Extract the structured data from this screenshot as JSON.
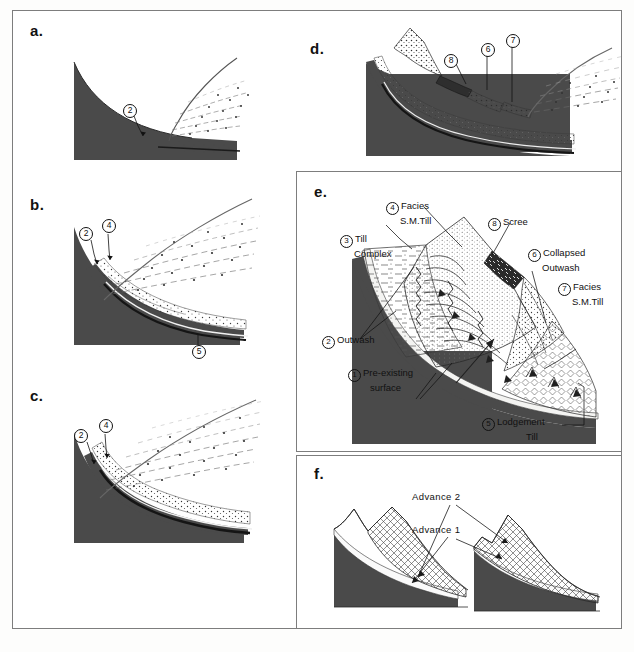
{
  "figure": {
    "panels": [
      {
        "id": "a",
        "letter": "a."
      },
      {
        "id": "b",
        "letter": "b."
      },
      {
        "id": "c",
        "letter": "c."
      },
      {
        "id": "d",
        "letter": "d."
      },
      {
        "id": "e",
        "letter": "e."
      },
      {
        "id": "f",
        "letter": "f."
      }
    ]
  },
  "panel_a": {
    "letter": "a.",
    "labels": [
      {
        "number": "2",
        "text": ""
      }
    ]
  },
  "panel_b": {
    "letter": "b.",
    "labels": [
      {
        "number": "2",
        "text": ""
      },
      {
        "number": "4",
        "text": ""
      },
      {
        "number": "5",
        "text": ""
      }
    ]
  },
  "panel_c": {
    "letter": "c.",
    "labels": [
      {
        "number": "2",
        "text": ""
      },
      {
        "number": "4",
        "text": ""
      }
    ]
  },
  "panel_d": {
    "letter": "d.",
    "labels": [
      {
        "number": "8",
        "text": ""
      },
      {
        "number": "6",
        "text": ""
      },
      {
        "number": "7",
        "text": ""
      }
    ]
  },
  "panel_e": {
    "letter": "e.",
    "labels": [
      {
        "number": "4",
        "line1": "Facies",
        "line2": "S.M.Till"
      },
      {
        "number": "3",
        "line1": "Till",
        "line2": "Complex"
      },
      {
        "number": "8",
        "line1": "Scree",
        "line2": ""
      },
      {
        "number": "6",
        "line1": "Collapsed",
        "line2": "Outwash"
      },
      {
        "number": "7",
        "line1": "Facies",
        "line2": "S.M.Till"
      },
      {
        "number": "2",
        "line1": "Outwash",
        "line2": ""
      },
      {
        "number": "1",
        "line1": "Pre-existing",
        "line2": "surface"
      },
      {
        "number": "5",
        "line1": "Lodgement",
        "line2": "Till"
      }
    ]
  },
  "panel_f": {
    "letter": "f.",
    "labels": [
      {
        "text": "Advance 2"
      },
      {
        "text": "Advance 1"
      }
    ]
  },
  "colors": {
    "ice_dark": "#4a4a4a",
    "frame": "#7d7d7d",
    "ink": "#111111",
    "paper": "#ffffff"
  },
  "caption": ""
}
